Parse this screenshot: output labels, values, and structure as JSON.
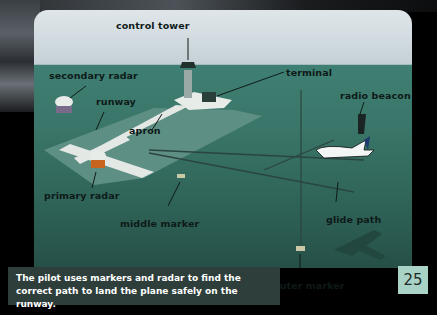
{
  "diagram": {
    "labels": {
      "control_tower": "control tower",
      "secondary_radar": "secondary radar",
      "terminal": "terminal",
      "runway": "runway",
      "apron": "apron",
      "radio_beacon": "radio beacon",
      "primary_radar": "primary radar",
      "middle_marker": "middle marker",
      "glide_path": "glide path",
      "outer_marker": "outer marker"
    }
  },
  "caption": {
    "text": "The pilot uses markers and radar to find the correct path to land the plane safely on the runway."
  },
  "page": {
    "number": "25"
  },
  "colors": {
    "ground": "#3a7669",
    "sky": "#dfe6ea",
    "runway": "#e4e8e4",
    "caption_bg": "#2d3e3b",
    "page_box": "#a9d3c6"
  }
}
